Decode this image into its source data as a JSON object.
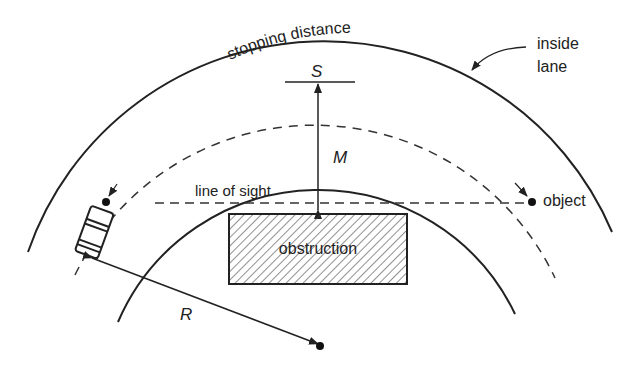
{
  "labels": {
    "stopping_distance": "stopping distance",
    "S": "S",
    "M": "M",
    "line_of_sight": "line of sight",
    "object": "object",
    "obstruction": "obstruction",
    "R": "R",
    "inside_lane_1": "inside",
    "inside_lane_2": "lane"
  },
  "colors": {
    "stroke": "#222222",
    "background": "#ffffff"
  }
}
